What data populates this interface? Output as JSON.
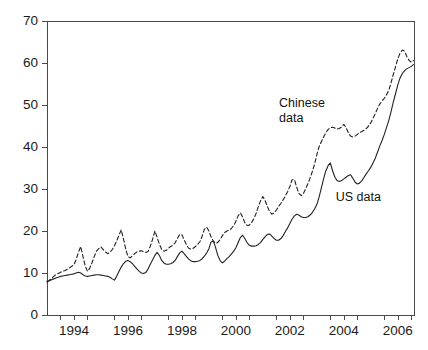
{
  "chart_data": {
    "type": "line",
    "title": "",
    "xlabel": "",
    "ylabel": "",
    "xlim": [
      1993.0,
      2006.6
    ],
    "ylim": [
      0,
      70
    ],
    "grid": false,
    "legend_position": "inline-annotations",
    "yticks": [
      0,
      10,
      20,
      30,
      40,
      50,
      60,
      70
    ],
    "ytick_labels": [
      "0",
      "10",
      "20",
      "30",
      "40",
      "50",
      "60",
      "70"
    ],
    "xticks": [
      1994,
      1996,
      1998,
      2000,
      2002,
      2004,
      2006
    ],
    "xtick_labels": [
      "1994",
      "1996",
      "1998",
      "2000",
      "2002",
      "2004",
      "2006"
    ],
    "minor_xticks": [
      1993.5,
      1994.5,
      1995.5,
      1996.5,
      1997.5,
      1998.5,
      1999.5,
      2000.5,
      2001.5,
      2002.5,
      2003.5,
      2004.5,
      2005.5,
      2006.5
    ],
    "annotations": [
      {
        "text_line1": "Chinese",
        "text_line2": "data",
        "x": 2001.6,
        "y": 50.5
      },
      {
        "text_line1": "US data",
        "text_line2": "",
        "x": 2003.7,
        "y": 28.0
      }
    ],
    "series": [
      {
        "name": "Chinese data",
        "style": "dashed",
        "color": "#222222",
        "x": [
          1993.0,
          1993.08,
          1993.17,
          1993.25,
          1993.33,
          1993.42,
          1993.5,
          1993.58,
          1993.67,
          1993.75,
          1993.83,
          1993.92,
          1994.0,
          1994.08,
          1994.17,
          1994.25,
          1994.33,
          1994.42,
          1994.5,
          1994.58,
          1994.67,
          1994.75,
          1994.83,
          1994.92,
          1995.0,
          1995.08,
          1995.17,
          1995.25,
          1995.33,
          1995.42,
          1995.5,
          1995.58,
          1995.67,
          1995.75,
          1995.83,
          1995.92,
          1996.0,
          1996.08,
          1996.17,
          1996.25,
          1996.33,
          1996.42,
          1996.5,
          1996.58,
          1996.67,
          1996.75,
          1996.83,
          1996.92,
          1997.0,
          1997.08,
          1997.17,
          1997.25,
          1997.33,
          1997.42,
          1997.5,
          1997.58,
          1997.67,
          1997.75,
          1997.83,
          1997.92,
          1998.0,
          1998.08,
          1998.17,
          1998.25,
          1998.33,
          1998.42,
          1998.5,
          1998.58,
          1998.67,
          1998.75,
          1998.83,
          1998.92,
          1999.0,
          1999.08,
          1999.17,
          1999.25,
          1999.33,
          1999.42,
          1999.5,
          1999.58,
          1999.67,
          1999.75,
          1999.83,
          1999.92,
          2000.0,
          2000.08,
          2000.17,
          2000.25,
          2000.33,
          2000.42,
          2000.5,
          2000.58,
          2000.67,
          2000.75,
          2000.83,
          2000.92,
          2001.0,
          2001.08,
          2001.17,
          2001.25,
          2001.33,
          2001.42,
          2001.5,
          2001.58,
          2001.67,
          2001.75,
          2001.83,
          2001.92,
          2002.0,
          2002.08,
          2002.17,
          2002.25,
          2002.33,
          2002.42,
          2002.5,
          2002.58,
          2002.67,
          2002.75,
          2002.83,
          2002.92,
          2003.0,
          2003.08,
          2003.17,
          2003.25,
          2003.33,
          2003.42,
          2003.5,
          2003.58,
          2003.67,
          2003.75,
          2003.83,
          2003.92,
          2004.0,
          2004.08,
          2004.17,
          2004.25,
          2004.33,
          2004.42,
          2004.5,
          2004.58,
          2004.67,
          2004.75,
          2004.83,
          2004.92,
          2005.0,
          2005.08,
          2005.17,
          2005.25,
          2005.33,
          2005.42,
          2005.5,
          2005.58,
          2005.67,
          2005.75,
          2005.83,
          2005.92,
          2006.0,
          2006.08,
          2006.17,
          2006.25,
          2006.33,
          2006.42,
          2006.5,
          2006.58
        ],
        "values": [
          8.0,
          8.3,
          8.7,
          9.2,
          9.6,
          9.9,
          10.2,
          10.4,
          10.6,
          10.9,
          11.2,
          11.6,
          12.0,
          13.2,
          15.0,
          16.3,
          14.0,
          11.6,
          10.4,
          11.1,
          12.5,
          13.9,
          15.2,
          15.8,
          16.2,
          15.6,
          15.0,
          14.6,
          14.9,
          15.6,
          16.5,
          17.6,
          19.0,
          20.3,
          18.2,
          15.6,
          13.9,
          13.6,
          14.1,
          14.6,
          15.0,
          15.2,
          15.3,
          15.1,
          14.9,
          15.2,
          16.4,
          18.2,
          20.0,
          18.5,
          16.8,
          15.6,
          15.2,
          15.4,
          15.9,
          16.3,
          16.6,
          17.2,
          18.2,
          19.2,
          19.1,
          17.9,
          16.7,
          15.9,
          15.7,
          15.9,
          16.3,
          16.8,
          17.5,
          18.8,
          20.4,
          20.9,
          20.0,
          18.6,
          17.5,
          17.0,
          17.3,
          18.0,
          18.9,
          19.6,
          20.0,
          20.2,
          20.6,
          21.3,
          22.3,
          23.6,
          24.3,
          23.3,
          22.0,
          21.3,
          21.4,
          22.0,
          23.0,
          24.2,
          25.8,
          27.3,
          28.2,
          27.3,
          25.8,
          24.6,
          24.0,
          24.3,
          25.0,
          25.8,
          26.6,
          27.4,
          28.3,
          29.4,
          30.6,
          32.2,
          32.2,
          30.5,
          29.0,
          28.4,
          28.9,
          30.0,
          31.3,
          32.6,
          34.1,
          36.0,
          38.2,
          40.0,
          41.3,
          42.4,
          43.4,
          44.2,
          44.6,
          44.7,
          44.5,
          44.3,
          44.4,
          44.8,
          45.4,
          44.6,
          43.4,
          42.6,
          42.4,
          42.6,
          43.0,
          43.4,
          43.7,
          44.0,
          44.4,
          45.0,
          45.8,
          46.8,
          48.0,
          49.2,
          50.2,
          51.0,
          51.6,
          52.4,
          53.6,
          55.3,
          57.2,
          59.2,
          61.0,
          62.3,
          63.1,
          62.8,
          61.6,
          60.6,
          60.2,
          60.6
        ]
      },
      {
        "name": "US data",
        "style": "solid",
        "color": "#222222",
        "x": [
          1993.0,
          1993.08,
          1993.17,
          1993.25,
          1993.33,
          1993.42,
          1993.5,
          1993.58,
          1993.67,
          1993.75,
          1993.83,
          1993.92,
          1994.0,
          1994.08,
          1994.17,
          1994.25,
          1994.33,
          1994.42,
          1994.5,
          1994.58,
          1994.67,
          1994.75,
          1994.83,
          1994.92,
          1995.0,
          1995.08,
          1995.17,
          1995.25,
          1995.33,
          1995.42,
          1995.5,
          1995.58,
          1995.67,
          1995.75,
          1995.83,
          1995.92,
          1996.0,
          1996.08,
          1996.17,
          1996.25,
          1996.33,
          1996.42,
          1996.5,
          1996.58,
          1996.67,
          1996.75,
          1996.83,
          1996.92,
          1997.0,
          1997.08,
          1997.17,
          1997.25,
          1997.33,
          1997.42,
          1997.5,
          1997.58,
          1997.67,
          1997.75,
          1997.83,
          1997.92,
          1998.0,
          1998.08,
          1998.17,
          1998.25,
          1998.33,
          1998.42,
          1998.5,
          1998.58,
          1998.67,
          1998.75,
          1998.83,
          1998.92,
          1999.0,
          1999.08,
          1999.17,
          1999.25,
          1999.33,
          1999.42,
          1999.5,
          1999.58,
          1999.67,
          1999.75,
          1999.83,
          1999.92,
          2000.0,
          2000.08,
          2000.17,
          2000.25,
          2000.33,
          2000.42,
          2000.5,
          2000.58,
          2000.67,
          2000.75,
          2000.83,
          2000.92,
          2001.0,
          2001.08,
          2001.17,
          2001.25,
          2001.33,
          2001.42,
          2001.5,
          2001.58,
          2001.67,
          2001.75,
          2001.83,
          2001.92,
          2002.0,
          2002.08,
          2002.17,
          2002.25,
          2002.33,
          2002.42,
          2002.5,
          2002.58,
          2002.67,
          2002.75,
          2002.83,
          2002.92,
          2003.0,
          2003.08,
          2003.17,
          2003.25,
          2003.33,
          2003.42,
          2003.5,
          2003.58,
          2003.67,
          2003.75,
          2003.83,
          2003.92,
          2004.0,
          2004.08,
          2004.17,
          2004.25,
          2004.33,
          2004.42,
          2004.5,
          2004.58,
          2004.67,
          2004.75,
          2004.83,
          2004.92,
          2005.0,
          2005.08,
          2005.17,
          2005.25,
          2005.33,
          2005.42,
          2005.5,
          2005.58,
          2005.67,
          2005.75,
          2005.83,
          2005.92,
          2006.0,
          2006.08,
          2006.17,
          2006.25,
          2006.33,
          2006.42,
          2006.5,
          2006.58
        ],
        "values": [
          7.9,
          8.1,
          8.4,
          8.6,
          8.8,
          9.0,
          9.2,
          9.3,
          9.4,
          9.5,
          9.6,
          9.7,
          9.8,
          10.0,
          10.2,
          10.0,
          9.6,
          9.3,
          9.2,
          9.3,
          9.4,
          9.5,
          9.6,
          9.6,
          9.5,
          9.4,
          9.3,
          9.2,
          9.0,
          8.6,
          8.3,
          9.2,
          10.4,
          11.4,
          12.2,
          12.8,
          13.0,
          12.7,
          12.2,
          11.6,
          11.0,
          10.4,
          10.0,
          9.9,
          10.2,
          11.0,
          12.1,
          13.2,
          14.2,
          14.9,
          14.1,
          13.0,
          12.4,
          12.1,
          12.1,
          12.2,
          12.5,
          13.0,
          13.9,
          14.8,
          15.2,
          14.6,
          13.9,
          13.3,
          12.9,
          12.7,
          12.7,
          12.8,
          13.0,
          13.4,
          14.0,
          14.8,
          15.8,
          17.4,
          17.6,
          16.0,
          14.2,
          12.9,
          12.4,
          12.8,
          13.4,
          13.9,
          14.5,
          15.2,
          16.0,
          17.2,
          18.5,
          19.0,
          18.2,
          17.2,
          16.6,
          16.4,
          16.4,
          16.5,
          16.8,
          17.3,
          18.0,
          18.6,
          19.2,
          19.3,
          18.8,
          18.2,
          17.8,
          17.8,
          18.2,
          18.9,
          19.8,
          20.8,
          21.8,
          22.8,
          23.6,
          24.0,
          23.8,
          23.4,
          23.2,
          23.2,
          23.4,
          23.8,
          24.4,
          25.3,
          26.3,
          28.0,
          30.3,
          32.4,
          34.3,
          35.6,
          36.2,
          34.4,
          32.8,
          32.0,
          31.8,
          32.0,
          32.4,
          32.8,
          33.2,
          33.4,
          32.6,
          31.6,
          31.2,
          31.4,
          32.0,
          32.8,
          33.6,
          34.4,
          35.2,
          36.2,
          37.4,
          38.8,
          40.2,
          41.6,
          43.0,
          44.6,
          46.4,
          48.4,
          50.6,
          52.8,
          54.8,
          56.4,
          57.5,
          58.2,
          58.6,
          58.9,
          59.2,
          59.6
        ]
      }
    ]
  },
  "axes": {
    "plot_left_px": 47,
    "plot_right_px": 414,
    "plot_top_px": 21,
    "plot_bottom_px": 315
  }
}
